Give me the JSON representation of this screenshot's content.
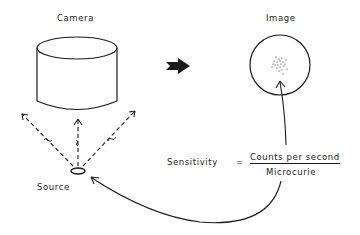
{
  "diagram": {
    "title_camera": "Camera",
    "title_image": "Image",
    "source_label": "Source",
    "equation": {
      "lhs": "Sensitivity",
      "equals": "=",
      "numerator": "Counts per second",
      "denominator": "Microcurie"
    },
    "colors": {
      "ink": "#1a1a1a",
      "background": "#ffffff"
    }
  }
}
